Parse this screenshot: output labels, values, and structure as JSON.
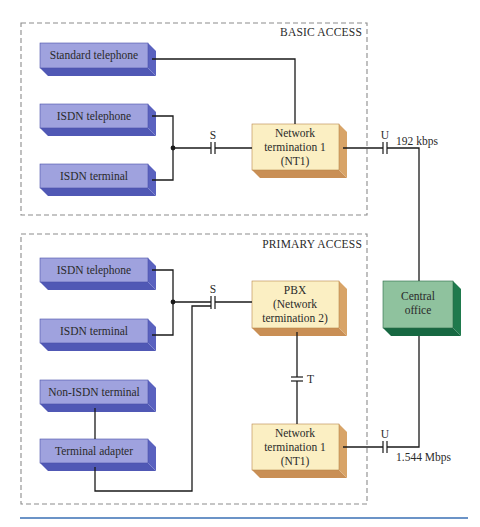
{
  "colors": {
    "device_front": "#9fa2de",
    "device_side": "#5a62bf",
    "device_bottom": "#5058b5",
    "nt_front": "#fbefc3",
    "nt_side": "#d8a468",
    "co_front": "#8fc29e",
    "co_side": "#1f7a4d",
    "wire": "#1a1a1a",
    "dashed_border": "#8c8c8c",
    "caption_rule": "#3a6fb5"
  },
  "basic_access": {
    "title": "BASIC ACCESS",
    "devices": [
      {
        "id": "standard-telephone",
        "label": "Standard telephone"
      },
      {
        "id": "isdn-telephone",
        "label": "ISDN telephone"
      },
      {
        "id": "isdn-terminal",
        "label": "ISDN terminal"
      }
    ],
    "s_point": "S",
    "nt1": {
      "lines": [
        "Network",
        "termination 1",
        "(NT1)"
      ]
    },
    "u_point": "U",
    "rate": "192 kbps"
  },
  "primary_access": {
    "title": "PRIMARY ACCESS",
    "devices": [
      {
        "id": "isdn-telephone",
        "label": "ISDN telephone"
      },
      {
        "id": "isdn-terminal",
        "label": "ISDN terminal"
      },
      {
        "id": "non-isdn-terminal",
        "label": "Non-ISDN terminal"
      },
      {
        "id": "terminal-adapter",
        "label": "Terminal adapter"
      }
    ],
    "s_point": "S",
    "pbx": {
      "lines": [
        "PBX",
        "(Network",
        "termination 2)"
      ]
    },
    "t_point": "T",
    "nt1": {
      "lines": [
        "Network",
        "termination 1",
        "(NT1)"
      ]
    },
    "u_point": "U",
    "rate": "1.544 Mbps"
  },
  "central_office": {
    "lines": [
      "Central",
      "office"
    ]
  }
}
